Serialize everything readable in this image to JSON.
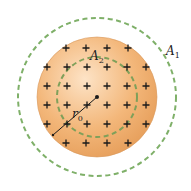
{
  "diagram": {
    "type": "charged-sphere-gaussian-surfaces",
    "sphere": {
      "label": "r",
      "label_sub": "0",
      "fill": "#f0b06e",
      "charge_symbol": "+"
    },
    "surfaces": [
      {
        "id": "A1",
        "label": "A",
        "label_sub": "1",
        "color": "#7fb069"
      },
      {
        "id": "A2",
        "label": "A",
        "label_sub": "2",
        "color": "#7fb069"
      }
    ]
  }
}
